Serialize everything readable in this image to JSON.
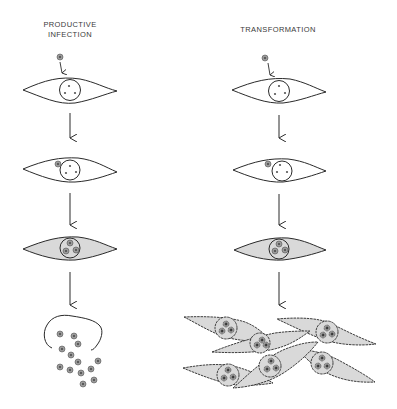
{
  "diagram": {
    "columns": [
      {
        "id": "productive",
        "title_line1": "PRODUCTIVE",
        "title_line2": "INFECTION",
        "stages": [
          "virus-attaches",
          "virus-enters",
          "virus-replicates",
          "cell-lysis-release-virions"
        ]
      },
      {
        "id": "transformation",
        "title_line1": "TRANSFORMATION",
        "stages": [
          "virus-attaches",
          "virus-enters",
          "viral-dna-integrated",
          "transformed-cell-proliferation"
        ]
      }
    ],
    "colors": {
      "line": "#2a2a2a",
      "cell_shaded": "#d9d9d9",
      "virion": "#8a8a8a",
      "background": "#ffffff"
    }
  }
}
